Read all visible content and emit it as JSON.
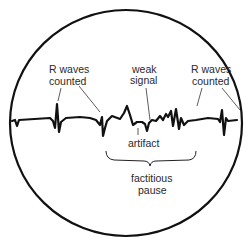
{
  "diagram": {
    "labels": {
      "r_waves_left_line1": "R waves",
      "r_waves_left_line2": "counted",
      "weak_signal_line1": "weak",
      "weak_signal_line2": "signal",
      "r_waves_right_line1": "R waves",
      "r_waves_right_line2": "counted",
      "artifact": "artifact",
      "factitious_pause_line1": "factitious",
      "factitious_pause_line2": "pause"
    },
    "colors": {
      "trace": "#111111",
      "text": "#2a2a2a",
      "background": "#ffffff"
    }
  }
}
